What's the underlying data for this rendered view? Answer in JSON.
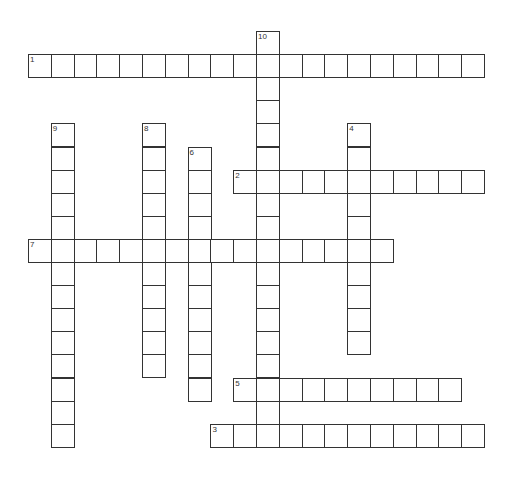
{
  "puzzle": {
    "type": "crossword",
    "colors": {
      "line": "#333333",
      "background": "#ffffff"
    },
    "words": [
      {
        "number": "1",
        "direction": "across",
        "length": 20
      },
      {
        "number": "2",
        "direction": "across",
        "length": 11
      },
      {
        "number": "3",
        "direction": "across",
        "length": 12
      },
      {
        "number": "4",
        "direction": "down",
        "length": 10
      },
      {
        "number": "5",
        "direction": "across",
        "length": 10
      },
      {
        "number": "6",
        "direction": "down",
        "length": 11
      },
      {
        "number": "7",
        "direction": "across",
        "length": 16
      },
      {
        "number": "8",
        "direction": "down",
        "length": 11
      },
      {
        "number": "9",
        "direction": "down",
        "length": 14
      },
      {
        "number": "10",
        "direction": "down",
        "length": 18
      }
    ]
  }
}
